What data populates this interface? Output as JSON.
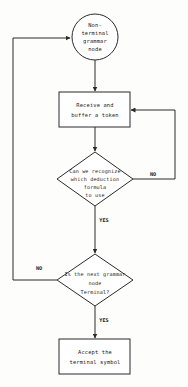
{
  "diagram": {
    "background_color": "#fdfdfc",
    "line_color": "#2b2b2b",
    "text_color": "#1a1a1a",
    "nodes": {
      "start": {
        "shape": "circle",
        "lines": [
          "Non-",
          "terminal",
          "grammar",
          "node"
        ]
      },
      "receive": {
        "shape": "process",
        "lines": [
          "Receive and",
          "buffer a token"
        ]
      },
      "recognize": {
        "shape": "decision",
        "lines": [
          "Can we recognize",
          "which deduction",
          "formula",
          "to use"
        ]
      },
      "terminal_check": {
        "shape": "decision",
        "lines": [
          "Is the next grammar",
          "node",
          "Terminal?"
        ]
      },
      "accept": {
        "shape": "process",
        "lines": [
          "Accept the",
          "terminal symbol"
        ]
      }
    },
    "edge_labels": {
      "recognize_no": "NO",
      "recognize_yes": "YES",
      "terminal_no": "NO",
      "terminal_yes": "YES"
    }
  }
}
